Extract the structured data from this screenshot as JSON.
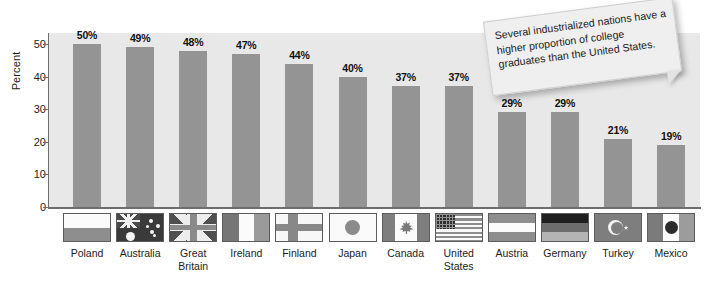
{
  "chart_data": {
    "type": "bar",
    "title": "",
    "xlabel": "",
    "ylabel": "Percent",
    "ylim": [
      0,
      50
    ],
    "yticks": [
      0,
      10,
      20,
      30,
      40,
      50
    ],
    "grid": false,
    "legend": "none",
    "categories": [
      "Poland",
      "Australia",
      "Great Britain",
      "Ireland",
      "Finland",
      "Japan",
      "Canada",
      "United States",
      "Austria",
      "Germany",
      "Turkey",
      "Mexico"
    ],
    "values": [
      50,
      49,
      48,
      47,
      44,
      40,
      37,
      37,
      29,
      29,
      21,
      19
    ],
    "value_labels": [
      "50%",
      "49%",
      "48%",
      "47%",
      "44%",
      "40%",
      "37%",
      "37%",
      "29%",
      "29%",
      "21%",
      "19%"
    ],
    "annotations": [
      "Several industrialized nations have a higher proportion of college graduates than the United States."
    ]
  },
  "axis": {
    "y_title": "Percent",
    "y_ticks": [
      "0",
      "10",
      "20",
      "30",
      "40",
      "50"
    ]
  },
  "callout": {
    "text": "Several industrialized nations have a higher proportion of college graduates than the United States."
  },
  "categories": [
    {
      "label": "Poland",
      "label_line1": "Poland",
      "label_line2": "",
      "flag": "flag-poland"
    },
    {
      "label": "Australia",
      "label_line1": "Australia",
      "label_line2": "",
      "flag": "flag-australia"
    },
    {
      "label": "Great Britain",
      "label_line1": "Great",
      "label_line2": "Britain",
      "flag": "flag-great-britain"
    },
    {
      "label": "Ireland",
      "label_line1": "Ireland",
      "label_line2": "",
      "flag": "flag-ireland"
    },
    {
      "label": "Finland",
      "label_line1": "Finland",
      "label_line2": "",
      "flag": "flag-finland"
    },
    {
      "label": "Japan",
      "label_line1": "Japan",
      "label_line2": "",
      "flag": "flag-japan"
    },
    {
      "label": "Canada",
      "label_line1": "Canada",
      "label_line2": "",
      "flag": "flag-canada"
    },
    {
      "label": "United States",
      "label_line1": "United",
      "label_line2": "States",
      "flag": "flag-united-states"
    },
    {
      "label": "Austria",
      "label_line1": "Austria",
      "label_line2": "",
      "flag": "flag-austria"
    },
    {
      "label": "Germany",
      "label_line1": "Germany",
      "label_line2": "",
      "flag": "flag-germany"
    },
    {
      "label": "Turkey",
      "label_line1": "Turkey",
      "label_line2": "",
      "flag": "flag-turkey"
    },
    {
      "label": "Mexico",
      "label_line1": "Mexico",
      "label_line2": "",
      "flag": "flag-mexico"
    }
  ],
  "colors": {
    "bar": "#949494",
    "plot_background": "#e8e8e8",
    "page_background": "#ffffff",
    "axis": "#6d6d6d",
    "text": "#1c1c1c",
    "callout_background": "#efefef"
  }
}
